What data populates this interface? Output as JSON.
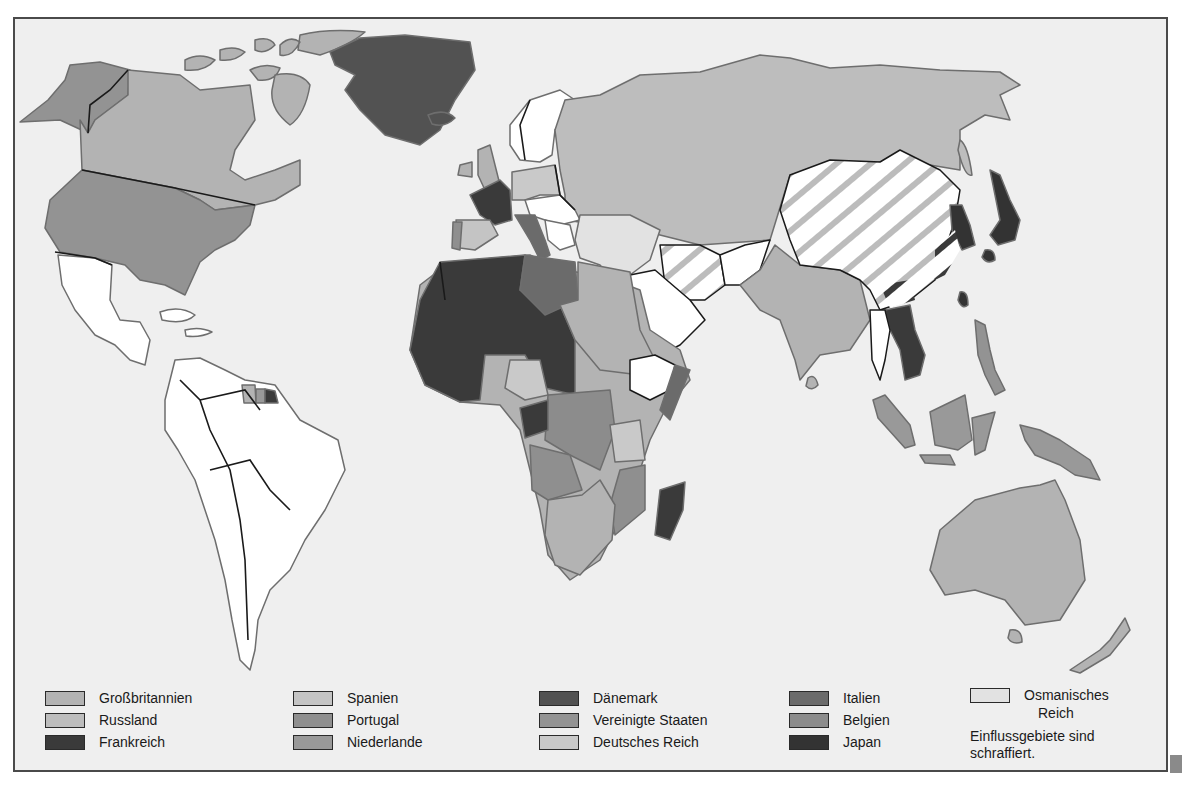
{
  "map": {
    "title": "",
    "type": "historical colonial empires world map (c. 1914)",
    "palette": {
      "ocean": "#efefef",
      "unclaimed": "#ffffff",
      "border": "#1a1a1a",
      "coast": "#6e6e6e",
      "grossbritannien": "#b3b3b3",
      "russland": "#bdbdbd",
      "frankreich": "#3a3a3a",
      "spanien": "#c4c4c4",
      "portugal": "#8f8f8f",
      "niederlande": "#999999",
      "daenemark": "#525252",
      "vereinigte_staaten": "#939393",
      "deutsches_reich": "#c9c9c9",
      "italien": "#6b6b6b",
      "belgien": "#8c8c8c",
      "japan": "#333333",
      "osmanisches_reich": "#e2e2e2",
      "hatch": "#bcbcbc"
    }
  },
  "legend": {
    "items": [
      {
        "label": "Großbritannien",
        "color": "#b3b3b3"
      },
      {
        "label": "Russland",
        "color": "#bdbdbd"
      },
      {
        "label": "Frankreich",
        "color": "#3a3a3a"
      },
      {
        "label": "Spanien",
        "color": "#c4c4c4"
      },
      {
        "label": "Portugal",
        "color": "#8f8f8f"
      },
      {
        "label": "Niederlande",
        "color": "#999999"
      },
      {
        "label": "Dänemark",
        "color": "#525252"
      },
      {
        "label": "Vereinigte Staaten",
        "color": "#939393"
      },
      {
        "label": "Deutsches Reich",
        "color": "#c9c9c9"
      },
      {
        "label": "Italien",
        "color": "#6b6b6b"
      },
      {
        "label": "Belgien",
        "color": "#8c8c8c"
      },
      {
        "label": "Japan",
        "color": "#333333"
      },
      {
        "label": "Osmanisches Reich",
        "color": "#e2e2e2"
      }
    ],
    "ottoman_line1": "Osmanisches",
    "ottoman_line2": "Reich",
    "note_line1": "Einflussgebiete sind",
    "note_line2": "schraffiert."
  }
}
